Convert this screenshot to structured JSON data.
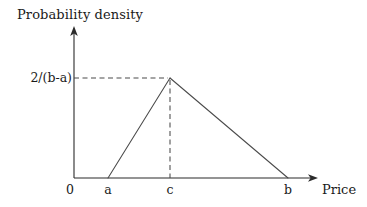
{
  "figure": {
    "background_color": "#ffffff",
    "line_color": "#4a4a4a",
    "axis_color": "#2b2b2b"
  },
  "labels": {
    "y_axis_title": "Probability density",
    "x_axis_title": "Price",
    "y_tick": "2/(b-a)",
    "origin": "0",
    "x_tick_a": "a",
    "x_tick_c": "c",
    "x_tick_b": "b"
  },
  "chart_data": {
    "type": "line",
    "title": "",
    "xlabel": "Price",
    "ylabel": "Probability density",
    "grid": false,
    "legend": null,
    "annotations": [
      {
        "text": "2/(b-a)",
        "kind": "y-tick",
        "describes": "peak probability density value at the mode c",
        "value_expression": "2/(b-a)"
      },
      {
        "text": "a",
        "kind": "x-tick",
        "describes": "lower bound of the triangular distribution"
      },
      {
        "text": "c",
        "kind": "x-tick",
        "describes": "mode (peak) of the triangular distribution"
      },
      {
        "text": "b",
        "kind": "x-tick",
        "describes": "upper bound of the triangular distribution"
      },
      {
        "text": "0",
        "kind": "origin",
        "describes": "origin of the axes"
      }
    ],
    "guide_lines": [
      {
        "style": "dashed",
        "orientation": "horizontal",
        "from": [
          "y-axis",
          "2/(b-a)"
        ],
        "to": [
          "c",
          "2/(b-a)"
        ]
      },
      {
        "style": "dashed",
        "orientation": "vertical",
        "from": [
          "c",
          "2/(b-a)"
        ],
        "to": [
          "c",
          "0"
        ]
      }
    ],
    "series": [
      {
        "name": "Triangular probability density function",
        "x_symbolic": [
          "a",
          "c",
          "b"
        ],
        "y_symbolic": [
          "0",
          "2/(b-a)",
          "0"
        ],
        "points_px": [
          [
            108,
            178
          ],
          [
            170,
            78
          ],
          [
            288,
            178
          ]
        ]
      }
    ],
    "axes_px": {
      "x_axis_y": 178,
      "y_axis_x": 74,
      "x_axis_start": 74,
      "x_axis_end": 318,
      "y_axis_top": 27,
      "y_axis_bottom": 178
    },
    "xlim_symbolic": [
      "0",
      "beyond b"
    ],
    "ylim_symbolic": [
      "0",
      "above 2/(b-a)"
    ]
  }
}
